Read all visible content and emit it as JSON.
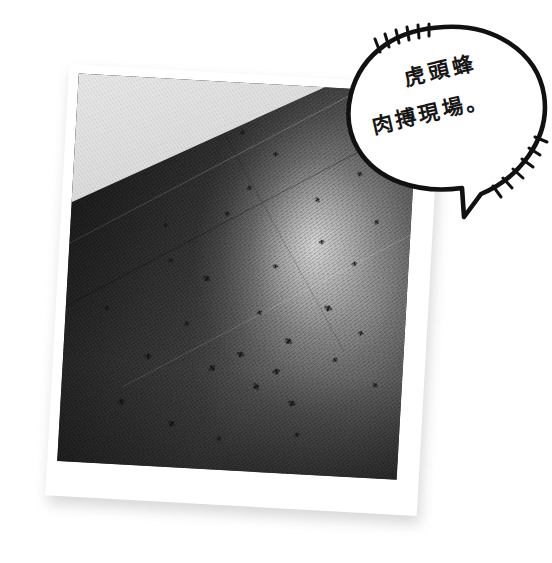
{
  "page": {
    "background_color": "#ffffff",
    "width": 552,
    "height": 563,
    "margin_text": "外\n別"
  },
  "photo": {
    "name": "tilted-photo-print",
    "border_color": "#ffffff",
    "rotation_deg": 3.2,
    "shadow_color": "#b8b8b8",
    "scene": {
      "description": "dark textured floor with scattered hornets and a bright light reflection",
      "ground_color": "#3a3a3a",
      "highlight_color": "#ffffff",
      "wall_corner_color": "#dcdcdc",
      "subject_color": "#121212",
      "subject_count": 31,
      "subjects": [
        {
          "x": 61,
          "y": 47,
          "r": 12,
          "size": "tiny"
        },
        {
          "x": 57,
          "y": 59,
          "r": -20,
          "size": "tiny"
        },
        {
          "x": 66,
          "y": 66,
          "r": 40,
          "size": "small"
        },
        {
          "x": 74,
          "y": 40,
          "r": -8,
          "size": "tiny"
        },
        {
          "x": 46,
          "y": 34,
          "r": 15,
          "size": "tiny"
        },
        {
          "x": 52,
          "y": 27,
          "r": -30,
          "size": "tiny"
        },
        {
          "x": 77,
          "y": 57,
          "r": 22,
          "size": "small"
        },
        {
          "x": 84,
          "y": 45,
          "r": -14,
          "size": "tiny"
        },
        {
          "x": 72,
          "y": 29,
          "r": 60,
          "size": "tiny"
        },
        {
          "x": 59,
          "y": 18,
          "r": 10,
          "size": "tiny"
        },
        {
          "x": 49,
          "y": 13,
          "r": -25,
          "size": "tiny"
        },
        {
          "x": 41,
          "y": 51,
          "r": 34,
          "size": "small"
        },
        {
          "x": 36,
          "y": 63,
          "r": -18,
          "size": "tiny"
        },
        {
          "x": 30,
          "y": 47,
          "r": 52,
          "size": "tiny"
        },
        {
          "x": 25,
          "y": 72,
          "r": 8,
          "size": "small"
        },
        {
          "x": 44,
          "y": 74,
          "r": -40,
          "size": "small"
        },
        {
          "x": 52,
          "y": 70,
          "r": 20,
          "size": "small"
        },
        {
          "x": 57,
          "y": 78,
          "r": 62,
          "size": "small"
        },
        {
          "x": 63,
          "y": 74,
          "r": -12,
          "size": "small"
        },
        {
          "x": 68,
          "y": 82,
          "r": 28,
          "size": "small"
        },
        {
          "x": 80,
          "y": 70,
          "r": -34,
          "size": "tiny"
        },
        {
          "x": 87,
          "y": 63,
          "r": 16,
          "size": "tiny"
        },
        {
          "x": 92,
          "y": 76,
          "r": 45,
          "size": "tiny"
        },
        {
          "x": 18,
          "y": 84,
          "r": -22,
          "size": "small"
        },
        {
          "x": 33,
          "y": 89,
          "r": 36,
          "size": "small"
        },
        {
          "x": 12,
          "y": 60,
          "r": 5,
          "size": "tiny"
        },
        {
          "x": 90,
          "y": 34,
          "r": -48,
          "size": "tiny"
        },
        {
          "x": 84,
          "y": 22,
          "r": 26,
          "size": "tiny"
        },
        {
          "x": 70,
          "y": 90,
          "r": -16,
          "size": "tiny"
        },
        {
          "x": 47,
          "y": 92,
          "r": 50,
          "size": "tiny"
        },
        {
          "x": 28,
          "y": 38,
          "r": -6,
          "size": "tiny"
        }
      ]
    }
  },
  "speech_bubble": {
    "name": "speech-bubble",
    "fill_color": "#ffffff",
    "stroke_color": "#111111",
    "line_1": "虎頭蜂",
    "line_2": "肉搏現場。",
    "full_text": "虎頭蜂肉搏現場。",
    "emphasis_marks_top": 6,
    "emphasis_marks_bottom": 6
  }
}
